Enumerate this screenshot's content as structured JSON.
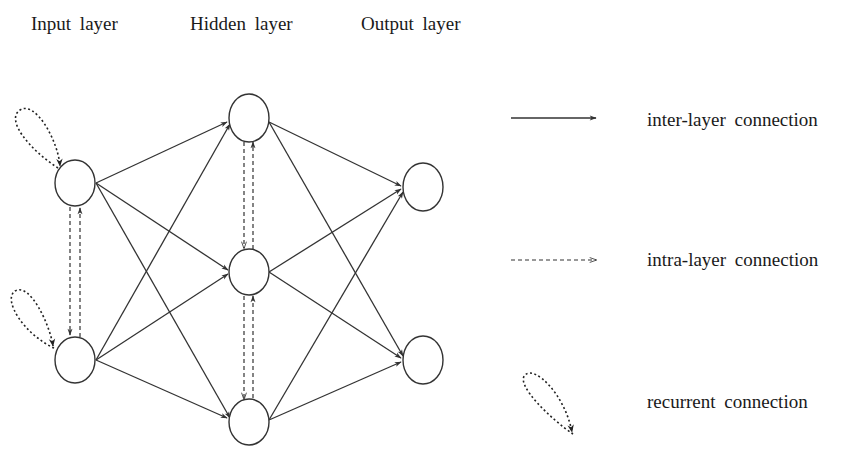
{
  "layers": {
    "input": {
      "label": "Input layer"
    },
    "hidden": {
      "label": "Hidden layer"
    },
    "output": {
      "label": "Output layer"
    }
  },
  "legend": {
    "inter": {
      "label": "inter-layer connection",
      "style": "solid"
    },
    "intra": {
      "label": "intra-layer connection",
      "style": "dashed"
    },
    "recurrent": {
      "label": "recurrent connection",
      "style": "dotted-loop"
    }
  },
  "nodes": {
    "input": [
      {
        "id": "i1",
        "cx": 75,
        "cy": 183
      },
      {
        "id": "i2",
        "cx": 75,
        "cy": 360
      }
    ],
    "hidden": [
      {
        "id": "h1",
        "cx": 249,
        "cy": 118
      },
      {
        "id": "h2",
        "cx": 249,
        "cy": 272
      },
      {
        "id": "h3",
        "cx": 249,
        "cy": 422
      }
    ],
    "output": [
      {
        "id": "o1",
        "cx": 423,
        "cy": 187
      },
      {
        "id": "o2",
        "cx": 423,
        "cy": 360
      }
    ]
  },
  "node_radius": {
    "rx": 20,
    "ry": 23
  },
  "colors": {
    "stroke": "#333333",
    "text": "#1a1a1a",
    "background": "#ffffff"
  }
}
